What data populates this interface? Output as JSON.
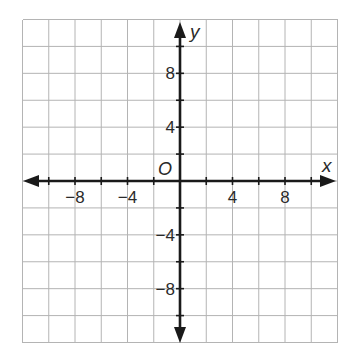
{
  "diagram": {
    "type": "coordinate-plane",
    "x_range": [
      -12,
      12
    ],
    "y_range": [
      -12,
      12
    ],
    "grid_step": 2,
    "x_axis_label": "x",
    "y_axis_label": "y",
    "origin_label": "O",
    "x_tick_labels": [
      {
        "value": -8,
        "text": "−8"
      },
      {
        "value": -4,
        "text": "−4"
      },
      {
        "value": 4,
        "text": "4"
      },
      {
        "value": 8,
        "text": "8"
      }
    ],
    "y_tick_labels": [
      {
        "value": 8,
        "text": "8"
      },
      {
        "value": 4,
        "text": "4"
      },
      {
        "value": -4,
        "text": "−4"
      },
      {
        "value": -8,
        "text": "−8"
      }
    ],
    "colors": {
      "grid": "#b4b4b4",
      "axes": "#1a1a1a",
      "text": "#2a2a2a",
      "background": "#ffffff"
    }
  }
}
